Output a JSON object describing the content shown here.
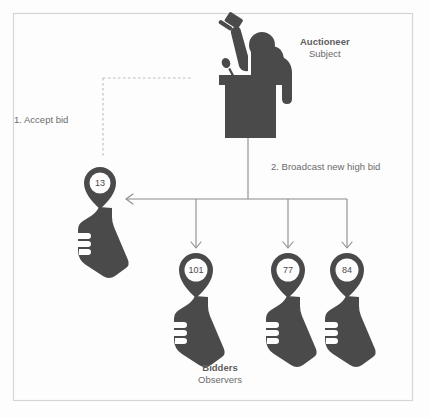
{
  "figure": {
    "border_color": "#d5d5d5",
    "background": "#fdfdfd",
    "ink_color": "#4a4a4a",
    "line_color": "#8a8a8a",
    "text_color": "#6a6a6a"
  },
  "subject": {
    "title": "Auctioneer",
    "role": "Subject",
    "icon": "auctioneer-podium-gavel-icon"
  },
  "observers": {
    "title": "Bidders",
    "role": "Observers"
  },
  "steps": {
    "step1": "1. Accept bid",
    "step2": "2. Broadcast new high bid"
  },
  "bidders": [
    {
      "id": "bidder-accepting",
      "value": "13",
      "icon": "hand-paddle-icon"
    },
    {
      "id": "bidder-1",
      "value": "101",
      "icon": "hand-paddle-icon"
    },
    {
      "id": "bidder-2",
      "value": "77",
      "icon": "hand-paddle-icon"
    },
    {
      "id": "bidder-3",
      "value": "84",
      "icon": "hand-paddle-icon"
    }
  ]
}
